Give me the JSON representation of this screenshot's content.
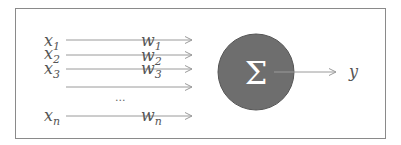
{
  "diagram": {
    "type": "perceptron",
    "inputs": [
      {
        "name": "x",
        "sub": "1",
        "weight": "w",
        "wsub": "1"
      },
      {
        "name": "x",
        "sub": "2",
        "weight": "w",
        "wsub": "2"
      },
      {
        "name": "x",
        "sub": "3",
        "weight": "w",
        "wsub": "3"
      },
      {
        "name": "",
        "sub": "",
        "weight": "",
        "wsub": ""
      },
      {
        "name": "x",
        "sub": "n",
        "weight": "w",
        "wsub": "n"
      }
    ],
    "ellipsis": "...",
    "node_symbol": "Σ",
    "output": "y",
    "colors": {
      "node_fill": "#6e6e6e",
      "node_stroke": "#555555",
      "arrow": "#9a9a9a",
      "frame": "#8a8a8a",
      "text": "#555555",
      "symbol": "#ffffff"
    }
  }
}
